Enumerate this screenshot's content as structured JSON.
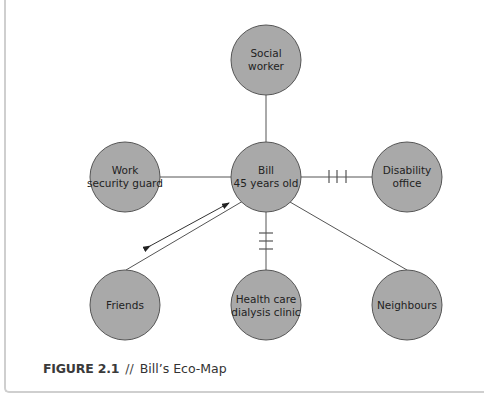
{
  "diagram": {
    "colors": {
      "node_fill": "#a9a9a9",
      "node_stroke": "#555555",
      "line": "#555555"
    },
    "nodes": [
      {
        "id": "social_worker",
        "lines": [
          "Social",
          "worker"
        ],
        "cx": 266,
        "cy": 60
      },
      {
        "id": "work",
        "lines": [
          "Work",
          "security guard"
        ],
        "cx": 125,
        "cy": 177
      },
      {
        "id": "bill",
        "lines": [
          "Bill",
          "45 years old"
        ],
        "cx": 266,
        "cy": 177
      },
      {
        "id": "disability",
        "lines": [
          "Disability",
          "office"
        ],
        "cx": 407,
        "cy": 177
      },
      {
        "id": "friends",
        "lines": [
          "Friends"
        ],
        "cx": 125,
        "cy": 305
      },
      {
        "id": "health",
        "lines": [
          "Health care",
          "dialysis clinic"
        ],
        "cx": 266,
        "cy": 305
      },
      {
        "id": "neighbours",
        "lines": [
          "Neighbours"
        ],
        "cx": 407,
        "cy": 305
      }
    ],
    "edges": [
      {
        "from": "bill",
        "to": "social_worker",
        "type": "normal"
      },
      {
        "from": "bill",
        "to": "work",
        "type": "normal"
      },
      {
        "from": "bill",
        "to": "disability",
        "type": "stressful"
      },
      {
        "from": "bill",
        "to": "health",
        "type": "stressful"
      },
      {
        "from": "bill",
        "to": "friends",
        "type": "normal",
        "flow": "bidirectional"
      },
      {
        "from": "bill",
        "to": "neighbours",
        "type": "normal"
      }
    ]
  },
  "caption": {
    "figure_label": "FIGURE 2.1",
    "separator": "//",
    "title": "Bill’s Eco-Map"
  }
}
